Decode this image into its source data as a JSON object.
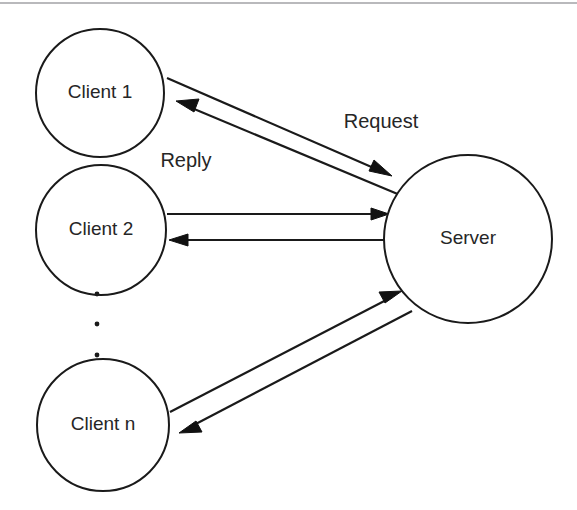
{
  "diagram": {
    "background_color": "#ffffff",
    "stroke_color": "#1a1a1a",
    "text_color": "#262626",
    "top_rule_color": "#b9b9bc",
    "nodes": [
      {
        "id": "client1",
        "label": "Client 1",
        "cx": 100,
        "cy": 93,
        "r": 64
      },
      {
        "id": "client2",
        "label": "Client 2",
        "cx": 101,
        "cy": 230,
        "r": 65
      },
      {
        "id": "clientn",
        "label": "Client n",
        "cx": 103,
        "cy": 425,
        "r": 66
      },
      {
        "id": "server",
        "label": "Server",
        "cx": 468,
        "cy": 239,
        "r": 84
      }
    ],
    "edge_labels": [
      {
        "id": "request",
        "text": "Request",
        "x": 381,
        "y": 123
      },
      {
        "id": "reply",
        "text": "Reply",
        "x": 186,
        "y": 162
      }
    ],
    "ellipsis_dots": [
      {
        "cx": 97,
        "cy": 294,
        "r": 2.4
      },
      {
        "cx": 97,
        "cy": 324,
        "r": 2.4
      },
      {
        "cx": 97,
        "cy": 355,
        "r": 2.4
      }
    ],
    "edges": [
      {
        "id": "client1-to-server-request",
        "from": "client1",
        "to": "server",
        "direction": "right",
        "label_ref": "request"
      },
      {
        "id": "server-to-client1-reply",
        "from": "server",
        "to": "client1",
        "direction": "left",
        "label_ref": "reply"
      },
      {
        "id": "client2-to-server-request",
        "from": "client2",
        "to": "server",
        "direction": "right",
        "label_ref": "request"
      },
      {
        "id": "server-to-client2-reply",
        "from": "server",
        "to": "client2",
        "direction": "left",
        "label_ref": "reply"
      },
      {
        "id": "clientn-to-server-request",
        "from": "clientn",
        "to": "server",
        "direction": "right",
        "label_ref": "request"
      },
      {
        "id": "server-to-clientn-reply",
        "from": "server",
        "to": "clientn",
        "direction": "left",
        "label_ref": "reply"
      }
    ]
  }
}
